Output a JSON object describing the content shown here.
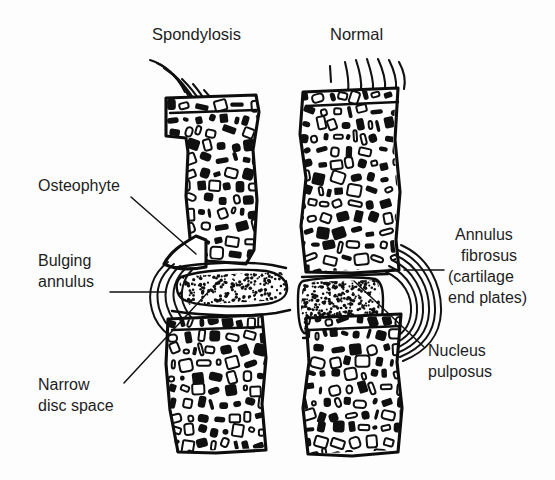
{
  "figure": {
    "kind": "anatomical-line-drawing",
    "background_color": "#fdfdfd",
    "ink_color": "#111111"
  },
  "titles": [
    {
      "id": "spondylosis",
      "text": "Spondylosis",
      "x": 152,
      "y": 40
    },
    {
      "id": "normal",
      "text": "Normal",
      "x": 330,
      "y": 40
    }
  ],
  "labels": [
    {
      "id": "osteophyte",
      "lines": [
        "Osteophyte"
      ],
      "side": "left",
      "text_anchor": "start",
      "x": 38,
      "y": 191,
      "line_height": 20,
      "leader": {
        "x1": 131,
        "y1": 197,
        "x2": 196,
        "y2": 254
      }
    },
    {
      "id": "bulging-annulus",
      "lines": [
        "Bulging",
        "annulus"
      ],
      "side": "left",
      "text_anchor": "start",
      "x": 38,
      "y": 266,
      "line_height": 21,
      "leader": {
        "x1": 110,
        "y1": 292,
        "x2": 166,
        "y2": 292
      }
    },
    {
      "id": "narrow-disc-space",
      "lines": [
        "Narrow",
        "disc space"
      ],
      "side": "left",
      "text_anchor": "start",
      "x": 38,
      "y": 390,
      "line_height": 21,
      "leader": {
        "x1": 124,
        "y1": 383,
        "x2": 211,
        "y2": 289
      }
    },
    {
      "id": "annulus-fibrosus",
      "lines": [
        "Annulus",
        "fibrosus",
        "(cartilage",
        "end plates)"
      ],
      "side": "right",
      "text_anchor": "start",
      "x": 451,
      "y": 240,
      "line_height": 21,
      "leader": {
        "x1": 444,
        "y1": 270,
        "x2": 404,
        "y2": 270
      }
    },
    {
      "id": "nucleus-pulposus",
      "lines": [
        "Nucleus",
        "pulposus"
      ],
      "side": "right",
      "text_anchor": "start",
      "x": 428,
      "y": 356,
      "line_height": 21,
      "leader": {
        "x1": 424,
        "y1": 347,
        "x2": 354,
        "y2": 281
      }
    }
  ],
  "specimens": [
    {
      "id": "spondylosis-segment",
      "title_ref": "spondylosis",
      "parts": [
        {
          "name": "superior-fibers",
          "style": "curved-buckled",
          "count": 6
        },
        {
          "name": "upper-vertebral-body",
          "texture": "trabecular"
        },
        {
          "name": "osteophyte-spur"
        },
        {
          "name": "narrow-disc-space",
          "texture": "stippled"
        },
        {
          "name": "bulging-annulus",
          "style": "wavy-lamellae",
          "count": 5
        },
        {
          "name": "lower-vertebral-body",
          "texture": "trabecular"
        }
      ]
    },
    {
      "id": "normal-segment",
      "title_ref": "normal",
      "parts": [
        {
          "name": "superior-fibers",
          "style": "straight",
          "count": 7
        },
        {
          "name": "upper-vertebral-body",
          "texture": "trabecular"
        },
        {
          "name": "nucleus-pulposus",
          "texture": "stippled"
        },
        {
          "name": "annulus-fibrosus",
          "style": "concentric-lamellae",
          "count": 6
        },
        {
          "name": "lower-vertebral-body",
          "texture": "trabecular"
        }
      ]
    }
  ]
}
